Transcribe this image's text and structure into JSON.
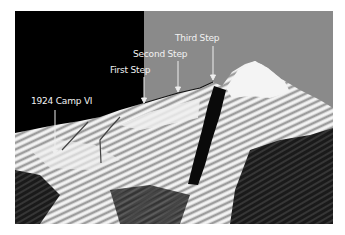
{
  "figure": {
    "colors": {
      "sky_left": "#000000",
      "sky_right": "#8a8a8a",
      "label_text": "#f2f2f2",
      "arrow": "#eeeeee",
      "route_line": "#444444"
    },
    "labels": [
      {
        "id": "camp-vi",
        "text": "1924 Camp VI"
      },
      {
        "id": "first-step",
        "text": "First Step"
      },
      {
        "id": "second-step",
        "text": "Second Step"
      },
      {
        "id": "third-step",
        "text": "Third Step"
      }
    ]
  }
}
